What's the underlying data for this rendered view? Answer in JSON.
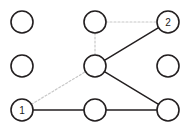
{
  "diagram": {
    "type": "node-link-graph",
    "background_color": "#ffffff",
    "canvas": {
      "width": 187,
      "height": 131
    },
    "grid": {
      "rows": 3,
      "cols": 3,
      "col_x": [
        22,
        95,
        168
      ],
      "row_y": [
        22,
        66,
        110
      ]
    },
    "node_style": {
      "radius": 11,
      "stroke_color": "#231f20",
      "stroke_width": 1.6,
      "fill_color": "#ffffff",
      "label_color": "#1a1a1a",
      "label_font_size": 10
    },
    "edge_styles": {
      "solid": {
        "color": "#231f20",
        "width": 1.5,
        "dash": "none"
      },
      "faint": {
        "color": "#c8c8c8",
        "width": 1.2,
        "dash": "2 2"
      }
    },
    "nodes": [
      {
        "id": "n00",
        "row": 0,
        "col": 0,
        "cx": 22,
        "cy": 22,
        "label": ""
      },
      {
        "id": "n01",
        "row": 0,
        "col": 1,
        "cx": 95,
        "cy": 22,
        "label": ""
      },
      {
        "id": "n02",
        "row": 0,
        "col": 2,
        "cx": 168,
        "cy": 22,
        "label": "2"
      },
      {
        "id": "n10",
        "row": 1,
        "col": 0,
        "cx": 22,
        "cy": 66,
        "label": ""
      },
      {
        "id": "n11",
        "row": 1,
        "col": 1,
        "cx": 95,
        "cy": 66,
        "label": ""
      },
      {
        "id": "n12",
        "row": 1,
        "col": 2,
        "cx": 168,
        "cy": 66,
        "label": ""
      },
      {
        "id": "n20",
        "row": 2,
        "col": 0,
        "cx": 22,
        "cy": 110,
        "label": "1"
      },
      {
        "id": "n21",
        "row": 2,
        "col": 1,
        "cx": 95,
        "cy": 110,
        "label": ""
      },
      {
        "id": "n22",
        "row": 2,
        "col": 2,
        "cx": 168,
        "cy": 110,
        "label": ""
      }
    ],
    "edges": [
      {
        "id": "e-n01-n02",
        "from": "n01",
        "to": "n02",
        "style": "faint"
      },
      {
        "id": "e-n01-n11",
        "from": "n01",
        "to": "n11",
        "style": "faint"
      },
      {
        "id": "e-n20-n11",
        "from": "n20",
        "to": "n11",
        "style": "faint"
      },
      {
        "id": "e-n11-n02",
        "from": "n11",
        "to": "n02",
        "style": "solid"
      },
      {
        "id": "e-n11-n22",
        "from": "n11",
        "to": "n22",
        "style": "solid"
      },
      {
        "id": "e-n20-n21",
        "from": "n20",
        "to": "n21",
        "style": "solid"
      },
      {
        "id": "e-n21-n22",
        "from": "n21",
        "to": "n22",
        "style": "solid"
      }
    ],
    "labeled_terminals": [
      {
        "node_id": "n20",
        "label": "1"
      },
      {
        "node_id": "n02",
        "label": "2"
      }
    ]
  }
}
